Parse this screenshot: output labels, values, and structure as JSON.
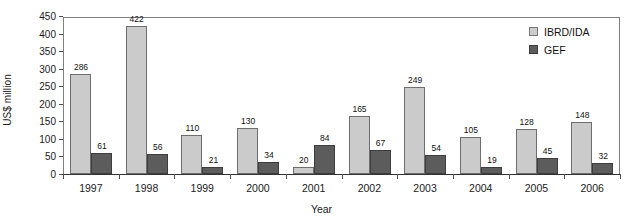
{
  "chart_data": {
    "type": "bar",
    "title": "",
    "xlabel": "Year",
    "ylabel": "US$ million",
    "categories": [
      "1997",
      "1998",
      "1999",
      "2000",
      "2001",
      "2002",
      "2003",
      "2004",
      "2005",
      "2006"
    ],
    "series": [
      {
        "name": "IBRD/IDA",
        "color": "#cbcbcb",
        "values": [
          286,
          422,
          110,
          130,
          20,
          165,
          249,
          105,
          128,
          148
        ]
      },
      {
        "name": "GEF",
        "color": "#5c5c5c",
        "values": [
          61,
          56,
          21,
          34,
          84,
          67,
          54,
          19,
          45,
          32
        ]
      }
    ],
    "ylim": [
      0,
      450
    ],
    "yticks": [
      0,
      50,
      100,
      150,
      200,
      250,
      300,
      350,
      400,
      450
    ],
    "ytick_labels": [
      "0",
      "50",
      "100",
      "150",
      "200",
      "250",
      "300",
      "350",
      "400",
      "450"
    ],
    "grid": false,
    "legend_position": "top-right",
    "data_labels": true
  },
  "legend": {
    "entries": [
      {
        "label": "IBRD/IDA",
        "swatch": "#cbcbcb"
      },
      {
        "label": "GEF",
        "swatch": "#5c5c5c"
      }
    ]
  },
  "axes": {
    "y_title": "US$ million",
    "x_title": "Year"
  }
}
